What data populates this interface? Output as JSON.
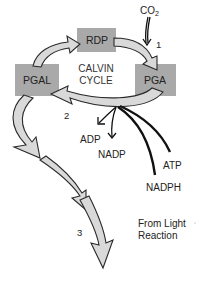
{
  "diagram": {
    "title": "Calvin Cycle",
    "nodes": {
      "rdp": "RDP",
      "pga": "PGA",
      "pgal": "PGAL"
    },
    "center_label": [
      "CALVIN",
      "CYCLE"
    ],
    "inputs": {
      "co2_main": "CO",
      "co2_sub": "2",
      "atp": "ATP",
      "nadph": "NADPH",
      "source": [
        "From Light",
        "Reaction"
      ]
    },
    "outputs": {
      "adp": "ADP",
      "nadp": "NADP"
    },
    "step_numbers": [
      "1",
      "2",
      "3"
    ],
    "colors": {
      "box_fill": "#a9a9a9",
      "arrow_fill": "#d9d9d9",
      "outline": "#2a2a2a"
    }
  }
}
